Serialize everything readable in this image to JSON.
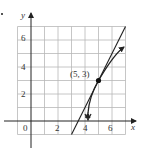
{
  "diagram": {
    "axes": {
      "x_label": "x",
      "y_label": "y",
      "x_ticks": [
        {
          "value": 0,
          "label": "0"
        },
        {
          "value": 2,
          "label": "2"
        },
        {
          "value": 4,
          "label": "4"
        },
        {
          "value": 6,
          "label": "6"
        }
      ],
      "y_ticks": [
        {
          "value": 2,
          "label": "2"
        },
        {
          "value": 4,
          "label": "4"
        },
        {
          "value": 6,
          "label": "6"
        }
      ],
      "grid": {
        "x_range": [
          -1,
          7
        ],
        "y_range": [
          -1,
          7
        ],
        "step": 1
      }
    },
    "point": {
      "x": 5,
      "y": 3,
      "label": "(5, 3)"
    },
    "tangent_line": {
      "slope": 2,
      "through": [
        5,
        3
      ],
      "from": [
        3,
        -1
      ],
      "to": [
        7,
        7
      ]
    },
    "curve": {
      "description": "curve through (5, 3) with arrowheads at both ends",
      "start": [
        4,
        0.5
      ],
      "end": [
        6.9,
        5.5
      ]
    },
    "colors": {
      "ink": "#222222",
      "grid": "#b8b8b8",
      "background": "#ffffff"
    }
  }
}
